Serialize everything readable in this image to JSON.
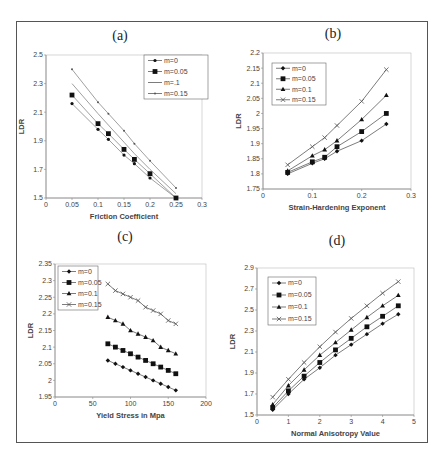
{
  "figure": {
    "panels": [
      "(a)",
      "(b)",
      "(c)",
      "(d)"
    ]
  },
  "chart_data": [
    {
      "id": "a",
      "panel_label": "(a)",
      "type": "line",
      "title": "(a)",
      "xlabel": "Friction Coefficient",
      "ylabel": "LDR",
      "xlim": [
        0,
        0.3
      ],
      "ylim": [
        1.5,
        2.5
      ],
      "xticks": [
        "0",
        "0.05",
        "0.1",
        "0.15",
        "0.2",
        "0.25",
        "0.3"
      ],
      "yticks": [
        "1.5",
        "1.7",
        "1.9",
        "2.1",
        "2.3",
        "2.5"
      ],
      "grid": false,
      "legend_position": "upper right",
      "x": [
        0.05,
        0.1,
        0.12,
        0.15,
        0.17,
        0.2,
        0.25
      ],
      "series": [
        {
          "name": "m=0",
          "marker": "dot",
          "values": [
            2.16,
            1.98,
            1.91,
            1.8,
            1.74,
            1.64,
            1.5
          ]
        },
        {
          "name": "m=0.05",
          "marker": "square",
          "values": [
            2.22,
            2.02,
            1.95,
            1.84,
            1.77,
            1.67,
            1.5
          ]
        },
        {
          "name": "m=.1",
          "marker": "none",
          "values": [
            2.3,
            2.09,
            2.01,
            1.89,
            1.81,
            1.7,
            1.53
          ]
        },
        {
          "name": "m=0.15",
          "marker": "dot-small",
          "values": [
            2.4,
            2.17,
            2.09,
            1.97,
            1.88,
            1.76,
            1.57
          ]
        }
      ]
    },
    {
      "id": "b",
      "panel_label": "(b)",
      "type": "line",
      "title": "(b)",
      "xlabel": "Strain-Hardening Exponent",
      "ylabel": "LDR",
      "xlim": [
        0,
        0.3
      ],
      "ylim": [
        1.75,
        2.2
      ],
      "xticks": [
        "0",
        "0.1",
        "0.2",
        "0.3"
      ],
      "yticks": [
        "1.75",
        "1.8",
        "1.85",
        "1.9",
        "1.95",
        "2",
        "2.05",
        "2.1",
        "2.15",
        "2.2"
      ],
      "grid": false,
      "legend_position": "upper left",
      "x": [
        0.05,
        0.1,
        0.125,
        0.15,
        0.2,
        0.25
      ],
      "series": [
        {
          "name": "m=0",
          "marker": "diamond",
          "values": [
            1.8,
            1.835,
            1.85,
            1.875,
            1.91,
            1.965
          ]
        },
        {
          "name": "m=0.05",
          "marker": "square",
          "values": [
            1.805,
            1.84,
            1.855,
            1.89,
            1.94,
            2.0
          ]
        },
        {
          "name": "m=0.1",
          "marker": "triangle",
          "values": [
            1.81,
            1.86,
            1.88,
            1.91,
            1.98,
            2.06
          ]
        },
        {
          "name": "m=0.15",
          "marker": "x",
          "values": [
            1.83,
            1.89,
            1.92,
            1.96,
            2.04,
            2.145
          ]
        }
      ]
    },
    {
      "id": "c",
      "panel_label": "(c)",
      "type": "line",
      "title": "(c)",
      "xlabel": "Yield Stress in Mpa",
      "ylabel": "LDR",
      "xlim": [
        0,
        200
      ],
      "ylim": [
        1.95,
        2.35
      ],
      "xticks": [
        "0",
        "50",
        "100",
        "150",
        "200"
      ],
      "yticks": [
        "1.95",
        "2",
        "2.05",
        "2.1",
        "2.15",
        "2.2",
        "2.25",
        "2.3",
        "2.35"
      ],
      "grid": false,
      "legend_position": "upper left",
      "x": [
        70,
        80,
        90,
        100,
        110,
        120,
        130,
        140,
        150,
        160
      ],
      "series": [
        {
          "name": "m=0",
          "marker": "diamond",
          "values": [
            2.06,
            2.05,
            2.04,
            2.03,
            2.02,
            2.01,
            2.0,
            1.99,
            1.98,
            1.97
          ]
        },
        {
          "name": "m=0.05",
          "marker": "square",
          "values": [
            2.11,
            2.1,
            2.09,
            2.08,
            2.07,
            2.06,
            2.05,
            2.04,
            2.03,
            2.02
          ]
        },
        {
          "name": "m=0.1",
          "marker": "triangle",
          "values": [
            2.19,
            2.18,
            2.17,
            2.15,
            2.14,
            2.13,
            2.12,
            2.1,
            2.09,
            2.08
          ]
        },
        {
          "name": "m=0.15",
          "marker": "x",
          "values": [
            2.29,
            2.27,
            2.26,
            2.25,
            2.24,
            2.22,
            2.21,
            2.2,
            2.18,
            2.17
          ]
        }
      ]
    },
    {
      "id": "d",
      "panel_label": "(d)",
      "type": "line",
      "title": "(d)",
      "xlabel": "Normal Anisotropy Value",
      "ylabel": "LDR",
      "xlim": [
        0,
        5
      ],
      "ylim": [
        1.5,
        2.9
      ],
      "xticks": [
        "0",
        "1",
        "2",
        "3",
        "4",
        "5"
      ],
      "yticks": [
        "1.5",
        "1.7",
        "1.9",
        "2.1",
        "2.3",
        "2.5",
        "2.7",
        "2.9"
      ],
      "grid": false,
      "legend_position": "upper left",
      "x": [
        0.5,
        1,
        1.5,
        2,
        2.5,
        3,
        3.5,
        4,
        4.5
      ],
      "series": [
        {
          "name": "m=0",
          "marker": "diamond",
          "values": [
            1.55,
            1.7,
            1.84,
            1.95,
            2.07,
            2.17,
            2.27,
            2.37,
            2.46
          ]
        },
        {
          "name": "m=0.05",
          "marker": "square",
          "values": [
            1.57,
            1.73,
            1.87,
            2.0,
            2.12,
            2.23,
            2.34,
            2.44,
            2.54
          ]
        },
        {
          "name": "m=0.1",
          "marker": "triangle",
          "values": [
            1.6,
            1.78,
            1.93,
            2.07,
            2.19,
            2.31,
            2.43,
            2.54,
            2.64
          ]
        },
        {
          "name": "m=0.15",
          "marker": "x",
          "values": [
            1.67,
            1.84,
            2.0,
            2.15,
            2.29,
            2.42,
            2.54,
            2.66,
            2.77
          ]
        }
      ]
    }
  ],
  "layout": {
    "plots": [
      {
        "id": "a",
        "px": [
          46,
          55,
          202,
          198
        ],
        "title_pos": [
          120,
          40
        ],
        "legend": [
          144,
          55,
          64,
          44
        ]
      },
      {
        "id": "b",
        "px": [
          263,
          53,
          411,
          189
        ],
        "title_pos": [
          333,
          38
        ],
        "legend": [
          272,
          63,
          54,
          42
        ]
      },
      {
        "id": "c",
        "px": [
          55,
          264,
          206,
          397
        ],
        "title_pos": [
          125,
          241
        ],
        "legend": [
          58,
          266,
          40,
          44
        ]
      },
      {
        "id": "d",
        "px": [
          257,
          268,
          414,
          415
        ],
        "title_pos": [
          337,
          245
        ],
        "legend": [
          268,
          277,
          48,
          48
        ]
      }
    ],
    "colors": {
      "line": "#444444",
      "marker": "#111111",
      "axis": "#888888"
    }
  }
}
